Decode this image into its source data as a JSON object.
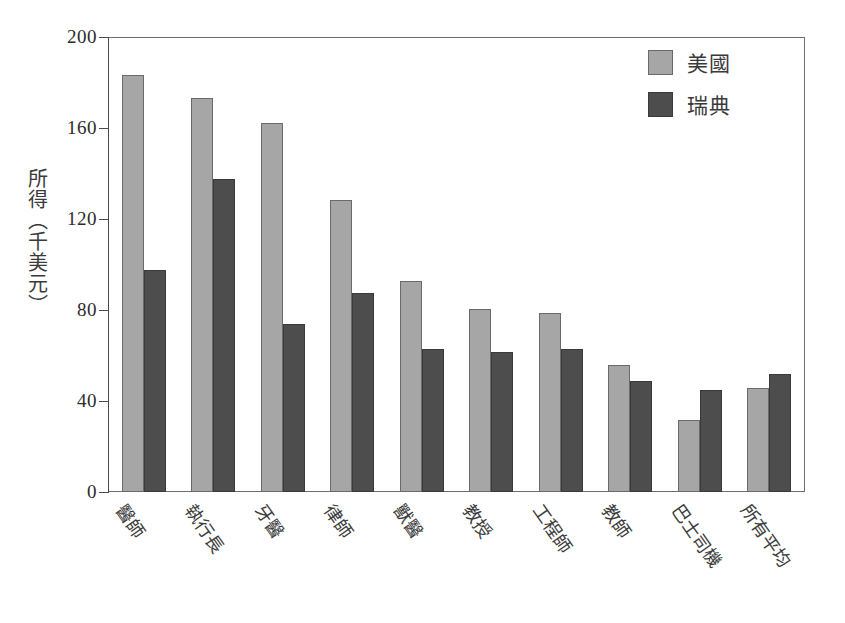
{
  "chart_data": {
    "type": "bar",
    "title": "",
    "xlabel": "",
    "ylabel": "所得（千美元）",
    "ylim": [
      0,
      200
    ],
    "yticks": [
      200,
      160,
      120,
      80,
      40,
      0
    ],
    "grid": false,
    "legend_position": "top-right",
    "categories": [
      "醫師",
      "執行長",
      "牙醫",
      "律師",
      "獸醫",
      "教授",
      "工程師",
      "教師",
      "巴士司機",
      "所有平均"
    ],
    "series": [
      {
        "name": "美國",
        "color": "#a6a6a6",
        "values": [
          184,
          174,
          163,
          129,
          93,
          81,
          79,
          56,
          32,
          46
        ]
      },
      {
        "name": "瑞典",
        "color": "#4d4d4d",
        "values": [
          98,
          138,
          74,
          88,
          63,
          62,
          63,
          49,
          45,
          52
        ]
      }
    ]
  },
  "axis": {
    "y_title": "所得（千美元）",
    "y_tick_labels": [
      "200",
      "160",
      "120",
      "80",
      "40",
      "0"
    ]
  },
  "legend": {
    "items": [
      {
        "label": "美國",
        "swatch": "light-gray-swatch"
      },
      {
        "label": "瑞典",
        "swatch": "dark-gray-swatch"
      }
    ]
  },
  "colors": {
    "series_us": "#a6a6a6",
    "series_se": "#4d4d4d",
    "axis": "#4a4a4a",
    "frame": "#6e6e6e",
    "background": "#ffffff",
    "text": "#2b2b2b"
  }
}
